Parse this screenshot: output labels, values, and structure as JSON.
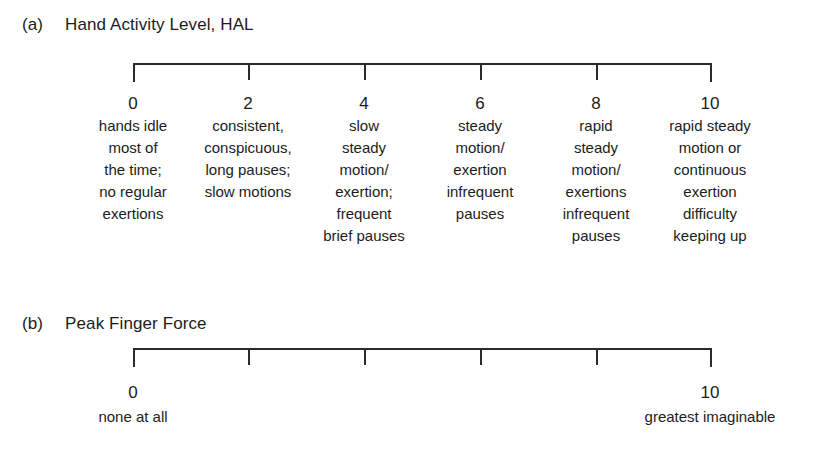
{
  "figure": {
    "background_color": "#ffffff",
    "ink_color": "#1c1c1c",
    "rule_color": "#2b2b2b"
  },
  "panels": [
    {
      "letter": "(a)",
      "title": "Hand Activity Level, HAL",
      "scale": {
        "min": 0,
        "max": 10,
        "tick_values": [
          "0",
          "2",
          "4",
          "6",
          "8",
          "10"
        ]
      },
      "columns": [
        {
          "value": "0",
          "lines": [
            "hands idle",
            "most of",
            "the time;",
            "no regular",
            "exertions"
          ]
        },
        {
          "value": "2",
          "lines": [
            "consistent,",
            "conspicuous,",
            "long pauses;",
            "slow motions"
          ]
        },
        {
          "value": "4",
          "lines": [
            "slow",
            "steady",
            "motion/",
            "exertion;",
            "frequent",
            "brief pauses"
          ]
        },
        {
          "value": "6",
          "lines": [
            "steady",
            "motion/",
            "exertion",
            "infrequent",
            "pauses"
          ]
        },
        {
          "value": "8",
          "lines": [
            "rapid",
            "steady",
            "motion/",
            "exertions",
            "infrequent",
            "pauses"
          ]
        },
        {
          "value": "10",
          "lines": [
            "rapid steady",
            "motion or",
            "continuous",
            "exertion",
            "difficulty",
            "keeping up"
          ]
        }
      ]
    },
    {
      "letter": "(b)",
      "title": "Peak Finger Force",
      "scale": {
        "min": 0,
        "max": 10,
        "tick_values": [
          "0",
          "",
          "",
          "",
          "",
          "10"
        ]
      },
      "anchors": {
        "left": {
          "value": "0",
          "label": "none at all"
        },
        "right": {
          "value": "10",
          "label": "greatest imaginable"
        }
      }
    }
  ]
}
